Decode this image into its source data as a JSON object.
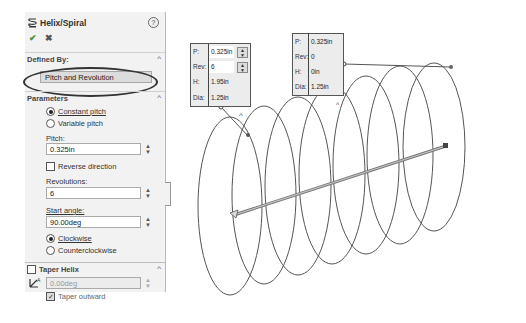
{
  "panel": {
    "title": "Helix/Spiral",
    "title_icon": "helix-icon",
    "help_icon": "help-icon",
    "ok_icon": "checkmark-icon",
    "cancel_icon": "close-icon",
    "ok_glyph": "✔",
    "cancel_glyph": "✖",
    "help_glyph": "?",
    "chevron_up": "^",
    "defined_by": {
      "label": "Defined By:",
      "value": "Pitch and Revolution"
    },
    "parameters": {
      "label": "Parameters",
      "pitch_mode_options": [
        {
          "label": "Constant pitch",
          "selected": true
        },
        {
          "label": "Variable pitch",
          "selected": false
        }
      ],
      "pitch_label": "Pitch:",
      "pitch_value": "0.325in",
      "reverse_direction_label": "Reverse direction",
      "reverse_direction_checked": false,
      "revolutions_label": "Revolutions:",
      "revolutions_value": "6",
      "start_angle_label": "Start angle:",
      "start_angle_value": "90.00deg",
      "direction_options": [
        {
          "label": "Clockwise",
          "selected": true
        },
        {
          "label": "Counterclockwise",
          "selected": false
        }
      ]
    },
    "taper": {
      "label": "Taper Helix",
      "checked": false,
      "angle_value": "0.00deg",
      "taper_outward_label": "Taper outward",
      "taper_outward_checked": true
    },
    "spinner_up": "▲",
    "spinner_down": "▼"
  },
  "callout_start": {
    "rows": [
      {
        "key": "P:",
        "value": "0.325in",
        "editable": true
      },
      {
        "key": "Rev:",
        "value": "6",
        "editable": true
      },
      {
        "key": "H:",
        "value": "1.95in",
        "editable": false
      },
      {
        "key": "Dia:",
        "value": "1.25in",
        "editable": false
      }
    ]
  },
  "callout_end": {
    "rows": [
      {
        "key": "P:",
        "value": "0.325in"
      },
      {
        "key": "Rev:",
        "value": "0"
      },
      {
        "key": "H:",
        "value": "0in"
      },
      {
        "key": "Dia:",
        "value": "1.25in"
      }
    ]
  },
  "viewport": {
    "helix_revolutions": 6,
    "line_color": "#555555",
    "axis_color": "#888888"
  }
}
